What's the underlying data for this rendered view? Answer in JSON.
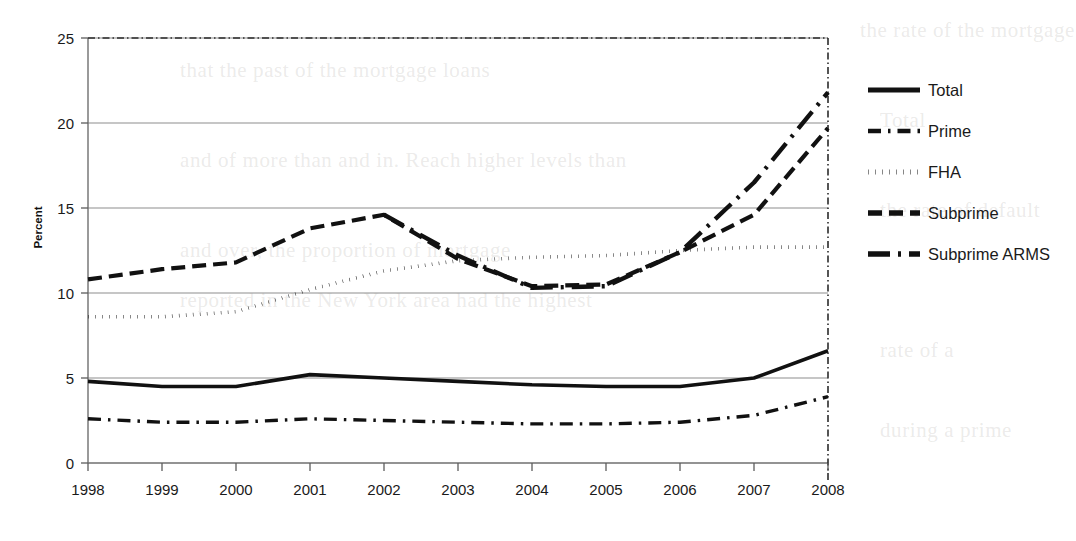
{
  "chart_data": {
    "type": "line",
    "title": "",
    "xlabel": "",
    "ylabel": "Percent",
    "x": [
      1998,
      1999,
      2000,
      2001,
      2002,
      2003,
      2004,
      2005,
      2006,
      2007,
      2008
    ],
    "categories": [
      "1998",
      "1999",
      "2000",
      "2001",
      "2002",
      "2003",
      "2004",
      "2005",
      "2006",
      "2007",
      "2008"
    ],
    "xlim": [
      1998,
      2008
    ],
    "ylim": [
      0,
      25
    ],
    "yticks": [
      0,
      5,
      10,
      15,
      20,
      25
    ],
    "ytick_labels": [
      "0",
      "5",
      "10",
      "15",
      "20",
      "25"
    ],
    "grid": "horizontal",
    "legend_position": "right",
    "series": [
      {
        "name": "Total",
        "style": "solid",
        "values": [
          4.8,
          4.5,
          4.5,
          5.2,
          5.0,
          4.8,
          4.6,
          4.5,
          4.5,
          5.0,
          6.6
        ]
      },
      {
        "name": "Prime",
        "style": "dash-dot",
        "values": [
          2.6,
          2.4,
          2.4,
          2.6,
          2.5,
          2.4,
          2.3,
          2.3,
          2.4,
          2.8,
          3.9
        ]
      },
      {
        "name": "FHA",
        "style": "dotted",
        "values": [
          8.6,
          8.6,
          8.9,
          10.2,
          11.3,
          11.9,
          12.1,
          12.2,
          12.5,
          12.7,
          12.7
        ]
      },
      {
        "name": "Subprime",
        "style": "dashed",
        "values": [
          10.8,
          11.4,
          11.8,
          13.8,
          14.6,
          12.0,
          10.4,
          10.5,
          12.4,
          14.6,
          19.7
        ]
      },
      {
        "name": "Subprime ARMS",
        "style": "long-dash-dot",
        "values": [
          null,
          null,
          null,
          null,
          14.6,
          12.2,
          10.3,
          10.4,
          12.4,
          16.5,
          21.8
        ]
      }
    ]
  },
  "legend": {
    "entries": [
      {
        "label": "Total",
        "swatch": "solid"
      },
      {
        "label": "Prime",
        "swatch": "dash-dot"
      },
      {
        "label": "FHA",
        "swatch": "dotted"
      },
      {
        "label": "Subprime",
        "swatch": "dashed"
      },
      {
        "label": "Subprime ARMS",
        "swatch": "long-dash-dot"
      }
    ]
  },
  "axes": {
    "y_title": "Percent",
    "y_labels": [
      "25",
      "20",
      "15",
      "10",
      "5",
      "0"
    ],
    "x_labels": [
      "1998",
      "1999",
      "2000",
      "2001",
      "2002",
      "2003",
      "2004",
      "2005",
      "2006",
      "2007",
      "2008"
    ]
  },
  "colors": {
    "ink": "#111111",
    "gridline": "#8d8d8d",
    "background": "#ffffff"
  },
  "background_text": {
    "lines": [
      "the rate of the mortgage",
      "that the past of the mortgage loans",
      "Total",
      "and of more than and in. Reach higher levels than",
      "the rate of default",
      "and over, the proportion of mortgage",
      "reported in the New York area had the highest",
      "rate of a",
      "during a prime"
    ]
  }
}
